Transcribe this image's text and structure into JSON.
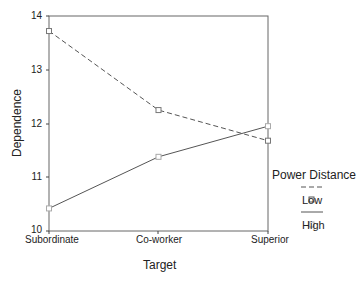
{
  "chart_data": {
    "type": "line",
    "title": "",
    "xlabel": "Target",
    "ylabel": "Dependence",
    "categories": [
      "Subordinate",
      "Co-worker",
      "Superior"
    ],
    "ylim": [
      10,
      14
    ],
    "yticks": [
      "14",
      "13",
      "12",
      "11",
      "10"
    ],
    "grid": false,
    "legend_position": "right",
    "legend_title": "Power Distance",
    "series": [
      {
        "name": "Low",
        "style": "dashed",
        "marker": "square",
        "values": [
          13.72,
          12.25,
          11.68
        ]
      },
      {
        "name": "High",
        "style": "solid",
        "marker": "square",
        "values": [
          10.42,
          11.38,
          11.95
        ]
      }
    ]
  },
  "axes": {
    "yticks": [
      "14",
      "13",
      "12",
      "11",
      "10"
    ],
    "xticks": [
      "Subordinate",
      "Co-worker",
      "Superior"
    ],
    "xlabel": "Target",
    "ylabel": "Dependence"
  },
  "legend": {
    "title": "Power Distance",
    "items": [
      {
        "label": "Low"
      },
      {
        "label": "High"
      }
    ]
  },
  "colors": {
    "line": "#555555",
    "frame": "#555555"
  }
}
